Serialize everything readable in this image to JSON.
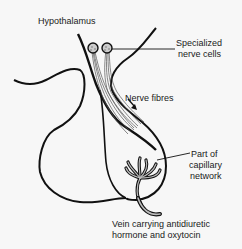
{
  "diagram": {
    "labels": {
      "hypothalamus": "Hypothalamus",
      "nerve_cells_line1": "Specialized",
      "nerve_cells_line2": "nerve cells",
      "nerve_fibres": "Nerve fibres",
      "capillary_line1": "Part of",
      "capillary_line2": "capillary",
      "capillary_line3": "network",
      "vein_line1": "Vein carrying antidiuretic",
      "vein_line2": "hormone and oxytocin"
    },
    "colors": {
      "ink": "#111111",
      "fibre": "#555555",
      "background": "#f7f7f7"
    }
  }
}
